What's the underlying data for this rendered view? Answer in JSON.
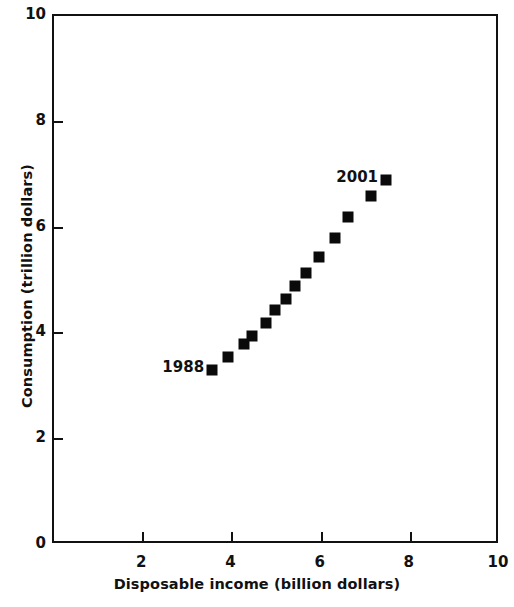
{
  "chart_data": {
    "type": "scatter",
    "title": "",
    "xlabel": "Disposable income (billion dollars)",
    "ylabel": "Consumption (trillion dollars)",
    "xlim": [
      0,
      10
    ],
    "ylim": [
      0,
      10
    ],
    "xticks": [
      0,
      2,
      4,
      6,
      8,
      10
    ],
    "yticks": [
      0,
      2,
      4,
      6,
      8,
      10
    ],
    "xtick_labels": [
      "0",
      "2",
      "4",
      "6",
      "8",
      "10"
    ],
    "ytick_labels": [
      "0",
      "2",
      "4",
      "6",
      "8",
      "10"
    ],
    "grid": false,
    "legend": false,
    "legend_position": "none",
    "marker": "square",
    "marker_color": "#0a0a0a",
    "series": [
      {
        "name": "Consumption vs disposable income",
        "points": [
          {
            "label": "1988",
            "x": 3.55,
            "y": 3.3
          },
          {
            "label": "1989",
            "x": 3.9,
            "y": 3.55
          },
          {
            "label": "1990",
            "x": 4.25,
            "y": 3.8
          },
          {
            "label": "1991",
            "x": 4.45,
            "y": 3.95
          },
          {
            "label": "1992",
            "x": 4.75,
            "y": 4.2
          },
          {
            "label": "1993",
            "x": 4.95,
            "y": 4.45
          },
          {
            "label": "1994",
            "x": 5.2,
            "y": 4.65
          },
          {
            "label": "1995",
            "x": 5.4,
            "y": 4.9
          },
          {
            "label": "1996",
            "x": 5.65,
            "y": 5.15
          },
          {
            "label": "1997",
            "x": 5.95,
            "y": 5.45
          },
          {
            "label": "1998",
            "x": 6.3,
            "y": 5.8
          },
          {
            "label": "1999",
            "x": 6.6,
            "y": 6.2
          },
          {
            "label": "2000",
            "x": 7.1,
            "y": 6.6
          },
          {
            "label": "2001",
            "x": 7.45,
            "y": 6.9
          }
        ]
      }
    ],
    "annotations": [
      {
        "text": "1988",
        "x": 3.55,
        "y": 3.3,
        "placement": "left"
      },
      {
        "text": "2001",
        "x": 7.45,
        "y": 6.9,
        "placement": "left"
      }
    ]
  }
}
